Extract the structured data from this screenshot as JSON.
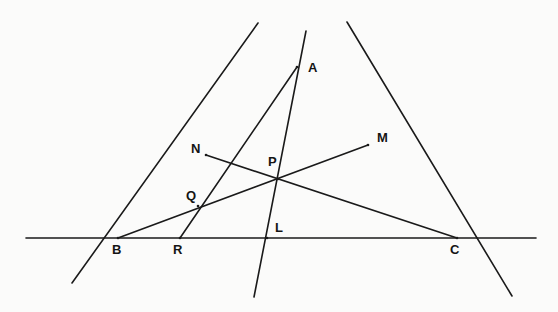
{
  "figure": {
    "kind": "geometry-diagram",
    "background_color": "#fbfbfa",
    "ink_color": "#1a1a1a",
    "width": 558,
    "height": 312
  },
  "points": [
    {
      "id": "A",
      "label": "A",
      "x": 297,
      "y": 67,
      "label_x": 308,
      "label_y": 61
    },
    {
      "id": "M",
      "label": "M",
      "x": 368,
      "y": 145,
      "label_x": 377,
      "label_y": 131
    },
    {
      "id": "N",
      "label": "N",
      "x": 206,
      "y": 155,
      "label_x": 191,
      "label_y": 142
    },
    {
      "id": "P",
      "label": "P",
      "x": 278,
      "y": 179,
      "label_x": 268,
      "label_y": 155
    },
    {
      "id": "Q",
      "label": "Q",
      "x": 198,
      "y": 206,
      "label_x": 186,
      "label_y": 189
    },
    {
      "id": "L",
      "label": "L",
      "x": 267,
      "y": 238,
      "label_x": 275,
      "label_y": 221
    },
    {
      "id": "B",
      "label": "B",
      "x": 118,
      "y": 238,
      "label_x": 112,
      "label_y": 243
    },
    {
      "id": "R",
      "label": "R",
      "x": 180,
      "y": 238,
      "label_x": 173,
      "label_y": 243
    },
    {
      "id": "C",
      "label": "C",
      "x": 457,
      "y": 238,
      "label_x": 450,
      "label_y": 243
    }
  ],
  "segments": [
    {
      "id": "baseline-bc-extended",
      "name": "line-BC-extended",
      "x1": 26,
      "y1": 238,
      "x2": 536,
      "y2": 238,
      "width": 1.6
    },
    {
      "id": "side-ab-extended",
      "name": "line-AB-extended",
      "x1": 258,
      "y1": 23,
      "x2": 72,
      "y2": 283,
      "width": 1.6
    },
    {
      "id": "side-ac-extended",
      "name": "line-AC-extended",
      "x1": 347,
      "y1": 22,
      "x2": 512,
      "y2": 296,
      "width": 1.6
    },
    {
      "id": "cevian-al-extended",
      "name": "line-AL-extended",
      "x1": 306,
      "y1": 31,
      "x2": 254,
      "y2": 297,
      "width": 1.6
    },
    {
      "id": "cevian-ar",
      "name": "segment-A-to-R",
      "x1": 297,
      "y1": 67,
      "x2": 180,
      "y2": 238,
      "width": 1.6
    },
    {
      "id": "cevian-bm",
      "name": "segment-B-to-M",
      "x1": 118,
      "y1": 238,
      "x2": 368,
      "y2": 145,
      "width": 1.6
    },
    {
      "id": "transversal-nc",
      "name": "segment-N-to-C",
      "x1": 206,
      "y1": 155,
      "x2": 457,
      "y2": 238,
      "width": 1.6
    }
  ]
}
